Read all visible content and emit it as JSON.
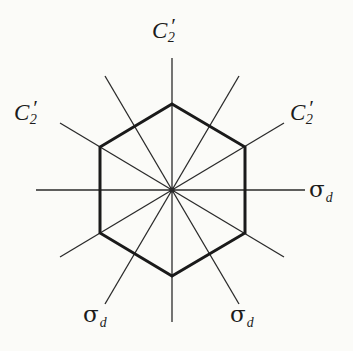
{
  "figure": {
    "kind": "point-group-symmetry-diagram",
    "background_color": "#fbfbf8",
    "line_color": "#2a2a2a",
    "hexagon_stroke_color": "#1a1a1a",
    "hexagon_stroke_width": 3,
    "axis_stroke_width": 1.3
  },
  "labels": {
    "c2_top": {
      "base": "C",
      "sub": "2",
      "prime": "′",
      "text": "C2′"
    },
    "c2_left": {
      "base": "C",
      "sub": "2",
      "prime": "′",
      "text": "C2′"
    },
    "c2_right": {
      "base": "C",
      "sub": "2",
      "prime": "′",
      "text": "C2′"
    },
    "sigma_right": {
      "base": "σ",
      "sub": "d",
      "text": "σd"
    },
    "sigma_bottom_left": {
      "base": "σ",
      "sub": "d",
      "text": "σd"
    },
    "sigma_bottom_right": {
      "base": "σ",
      "sub": "d",
      "text": "σd"
    }
  },
  "geometry": {
    "center": {
      "x": 172,
      "y": 190
    },
    "hexagon_circumradius": 86,
    "hexagon_vertices": [
      {
        "x": 172,
        "y": 104
      },
      {
        "x": 245,
        "y": 147
      },
      {
        "x": 245,
        "y": 233
      },
      {
        "x": 172,
        "y": 276
      },
      {
        "x": 100,
        "y": 233
      },
      {
        "x": 100,
        "y": 147
      }
    ],
    "axes": [
      {
        "name": "vertical-c2-axis",
        "angle_deg": 90,
        "x1": 172,
        "y1": 58,
        "x2": 172,
        "y2": 322
      },
      {
        "name": "horizontal-sigma-axis",
        "angle_deg": 0,
        "x1": 36,
        "y1": 190,
        "x2": 305,
        "y2": 190
      },
      {
        "name": "upper-left-c2-axis",
        "angle_deg": 30,
        "x1": 60,
        "y1": 123,
        "x2": 284,
        "y2": 257
      },
      {
        "name": "upper-right-c2-axis",
        "angle_deg": 150,
        "x1": 284,
        "y1": 123,
        "x2": 60,
        "y2": 257
      },
      {
        "name": "steep-left-sigma-axis",
        "angle_deg": 60,
        "x1": 105,
        "y1": 76,
        "x2": 239,
        "y2": 304
      },
      {
        "name": "steep-right-sigma-axis",
        "angle_deg": 120,
        "x1": 239,
        "y1": 76,
        "x2": 105,
        "y2": 304
      }
    ]
  }
}
